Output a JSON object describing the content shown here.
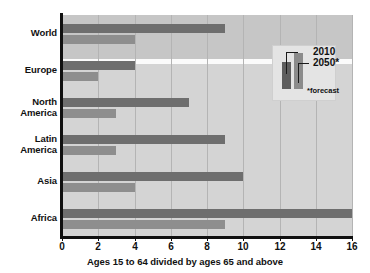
{
  "chart_data": {
    "type": "bar",
    "orientation": "horizontal",
    "title": "",
    "xlabel": "Ages 15 to 64 divided by ages 65 and above",
    "ylabel": "",
    "xlim": [
      0,
      16
    ],
    "xticks": [
      0,
      2,
      4,
      6,
      8,
      10,
      12,
      14,
      16
    ],
    "xtick_labels": [
      "0",
      "2",
      "4",
      "6",
      "8",
      "10",
      "12",
      "14",
      "16"
    ],
    "grid": true,
    "grid_axis": "x",
    "legend_position": "upper right",
    "categories": [
      "World",
      "Europe",
      "North America",
      "Latin America",
      "Asia",
      "Africa"
    ],
    "category_labels": [
      "World",
      "Europe",
      "North\nAmerica",
      "Latin\nAmerica",
      "Asia",
      "Africa"
    ],
    "series": [
      {
        "name": "2010",
        "color": "#6e6e6e",
        "values": [
          9,
          4,
          7,
          9,
          10,
          16
        ]
      },
      {
        "name": "2050*",
        "color": "#8e8e8e",
        "values": [
          4,
          2,
          3,
          3,
          4,
          9
        ]
      }
    ],
    "annotations": [
      "*forecast"
    ]
  },
  "legend": {
    "entries": [
      {
        "label": "2010",
        "color": "#6e6e6e"
      },
      {
        "label": "2050*",
        "color": "#8e8e8e"
      }
    ],
    "note": "*forecast"
  },
  "axis": {
    "x_title": "Ages 15 to 64 divided by ages 65 and above",
    "ticks": [
      "0",
      "2",
      "4",
      "6",
      "8",
      "10",
      "12",
      "14",
      "16"
    ]
  },
  "categories": [
    {
      "label": "World",
      "line1": "World",
      "line2": ""
    },
    {
      "label": "Europe",
      "line1": "Europe",
      "line2": ""
    },
    {
      "label": "North America",
      "line1": "North",
      "line2": "America"
    },
    {
      "label": "Latin America",
      "line1": "Latin",
      "line2": "America"
    },
    {
      "label": "Asia",
      "line1": "Asia",
      "line2": ""
    },
    {
      "label": "Africa",
      "line1": "Africa",
      "line2": ""
    }
  ],
  "colors": {
    "series_2010": "#6e6e6e",
    "series_2050": "#8e8e8e",
    "plot_background": "#d4d4d4",
    "plot_background_top": "#c6c6c6",
    "axis": "#101010",
    "gridline": "#b4b4b4",
    "legend_background": "#e4e4e4"
  }
}
